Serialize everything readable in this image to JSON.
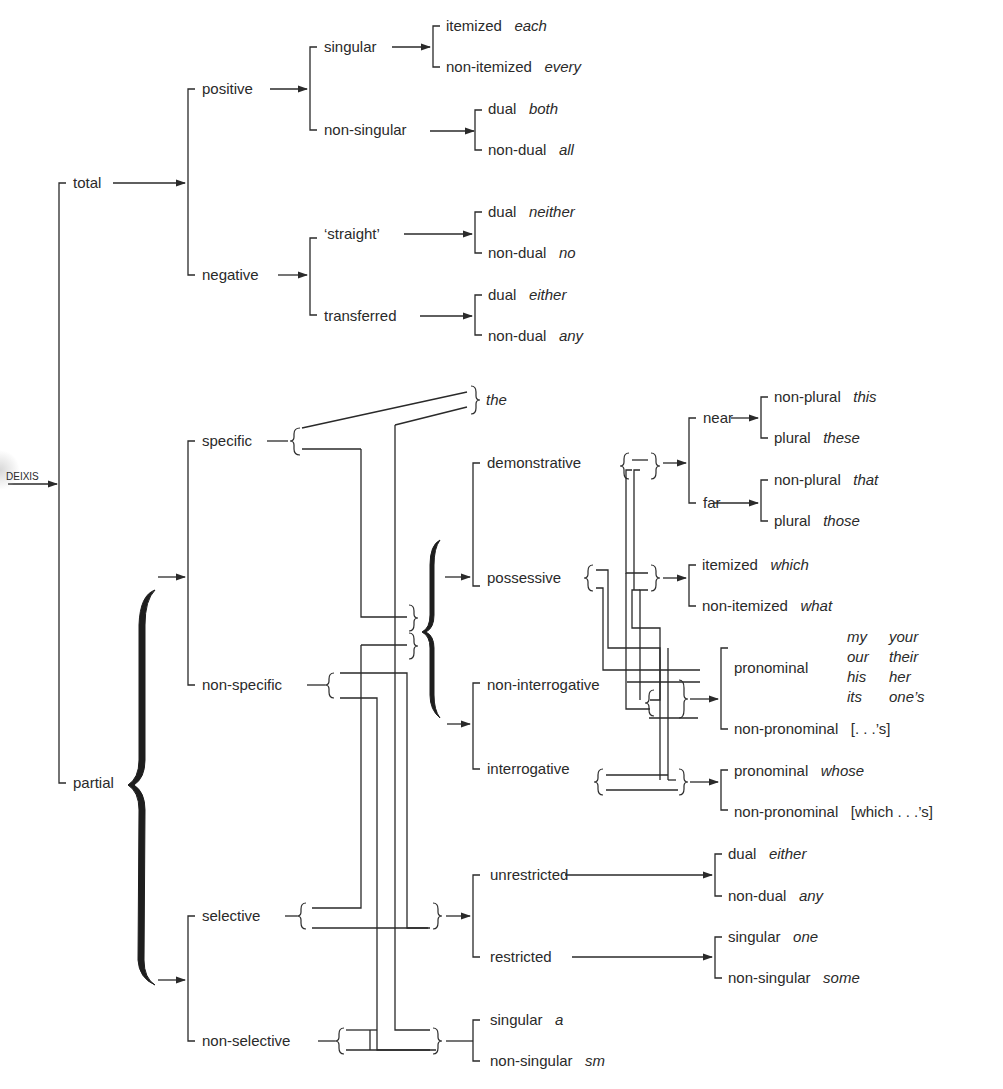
{
  "root": "DEIXIS",
  "level1": {
    "total": "total",
    "partial": "partial"
  },
  "total": {
    "positive": "positive",
    "negative": "negative",
    "singular": "singular",
    "non_singular": "non-singular",
    "straight": "‘straight’",
    "transferred": "transferred",
    "leaves": [
      {
        "feature": "itemized",
        "word": "each"
      },
      {
        "feature": "non-itemized",
        "word": "every"
      },
      {
        "feature": "dual",
        "word": "both"
      },
      {
        "feature": "non-dual",
        "word": "all"
      },
      {
        "feature": "dual",
        "word": "neither"
      },
      {
        "feature": "non-dual",
        "word": "no"
      },
      {
        "feature": "dual",
        "word": "either"
      },
      {
        "feature": "non-dual",
        "word": "any"
      }
    ]
  },
  "partial": {
    "specific": "specific",
    "non_specific": "non-specific",
    "selective": "selective",
    "non_selective": "non-selective",
    "the": "the",
    "demonstrative": "demonstrative",
    "possessive": "possessive",
    "non_interrogative": "non-interrogative",
    "interrogative": "interrogative",
    "near": "near",
    "far": "far",
    "unrestricted": "unrestricted",
    "restricted": "restricted",
    "demonstrative_leaves": [
      {
        "feature": "non-plural",
        "word": "this"
      },
      {
        "feature": "plural",
        "word": "these"
      },
      {
        "feature": "non-plural",
        "word": "that"
      },
      {
        "feature": "plural",
        "word": "those"
      }
    ],
    "wh_leaves": [
      {
        "feature": "itemized",
        "word": "which"
      },
      {
        "feature": "non-itemized",
        "word": "what"
      }
    ],
    "possessive_leaves": {
      "pronominal": "pronominal",
      "pronominal_words": [
        "my",
        "your",
        "our",
        "their",
        "his",
        "her",
        "its",
        "one’s"
      ],
      "non_pronominal": "non-pronominal",
      "non_pronominal_word": "[. . .’s]",
      "int_pronominal": "pronominal",
      "int_pronominal_word": "whose",
      "int_non_pronominal": "non-pronominal",
      "int_non_pronominal_word": "[which . . .’s]"
    },
    "selective_leaves": [
      {
        "feature": "dual",
        "word": "either"
      },
      {
        "feature": "non-dual",
        "word": "any"
      },
      {
        "feature": "singular",
        "word": "one"
      },
      {
        "feature": "non-singular",
        "word": "some"
      }
    ],
    "non_selective_leaves": [
      {
        "feature": "singular",
        "word": "a"
      },
      {
        "feature": "non-singular",
        "word": "sm"
      }
    ]
  }
}
